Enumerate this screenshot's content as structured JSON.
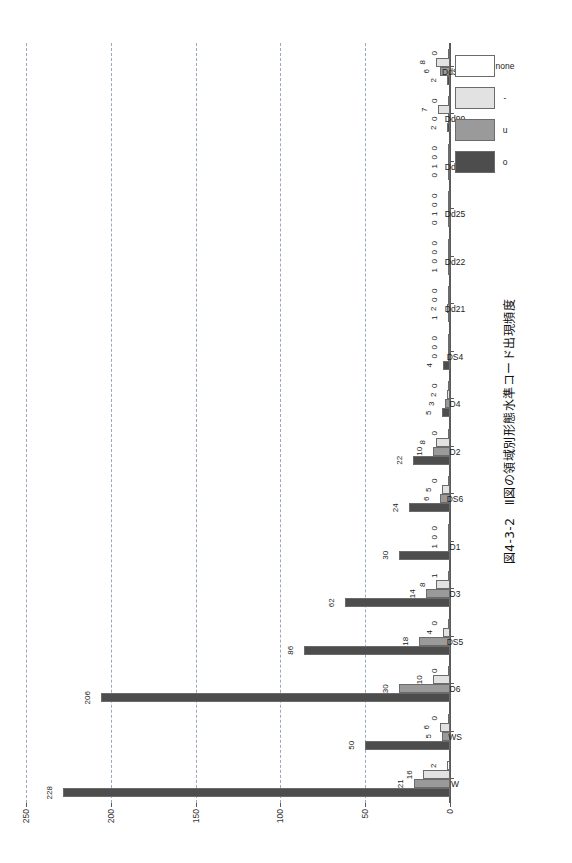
{
  "figure": {
    "title": "図4-3-2　Ⅱ図の領域別形態水準コード出現頻度",
    "legend_position": "top-left (rotated)",
    "orientation": "rotated-90"
  },
  "legend": {
    "items": [
      {
        "label": "o",
        "color": "#4d4d4d"
      },
      {
        "label": "u",
        "color": "#9a9a9a"
      },
      {
        "label": "-",
        "color": "#e2e2e2"
      },
      {
        "label": "none",
        "color": "#ffffff"
      }
    ]
  },
  "axis": {
    "value_ticks": [
      "0",
      "50",
      "100",
      "150",
      "200",
      "250"
    ],
    "value_min": 0,
    "value_max": 250
  },
  "chart_data": {
    "type": "bar",
    "title": "図4-3-2　Ⅱ図の領域別形態水準コード出現頻度",
    "xlabel": "",
    "ylabel": "",
    "ylim": [
      0,
      250
    ],
    "yticks": [
      0,
      50,
      100,
      150,
      200,
      250
    ],
    "grid": true,
    "legend_position": "top-left",
    "orientation": "horizontal-rotated",
    "categories": [
      "W",
      "WS",
      "D6",
      "DS5",
      "D3",
      "D1",
      "DS6",
      "D2",
      "D4",
      "DS4",
      "Dd21",
      "Dd22",
      "Dd25",
      "Dd31",
      "Dd99",
      "DdS99"
    ],
    "series": [
      {
        "name": "o",
        "color": "#4d4d4d",
        "values": [
          228,
          50,
          206,
          86,
          62,
          30,
          24,
          22,
          5,
          4,
          1,
          1,
          0,
          0,
          2,
          2
        ]
      },
      {
        "name": "u",
        "color": "#9a9a9a",
        "values": [
          21,
          5,
          30,
          18,
          14,
          1,
          6,
          10,
          3,
          0,
          2,
          0,
          1,
          1,
          0,
          6
        ]
      },
      {
        "name": "-",
        "color": "#e2e2e2",
        "values": [
          16,
          6,
          10,
          4,
          8,
          0,
          5,
          8,
          2,
          0,
          0,
          0,
          0,
          0,
          7,
          8
        ]
      },
      {
        "name": "none",
        "color": "#ffffff",
        "values": [
          2,
          0,
          0,
          0,
          1,
          0,
          0,
          0,
          0,
          0,
          0,
          0,
          0,
          0,
          0,
          0
        ]
      }
    ]
  }
}
